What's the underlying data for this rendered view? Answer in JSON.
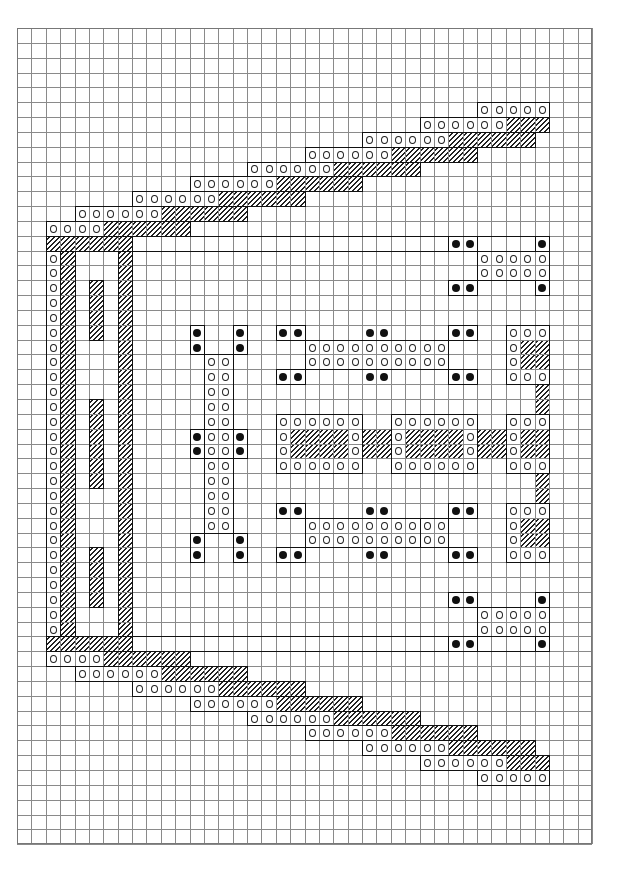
{
  "chart_data": {
    "type": "cross-stitch-chart",
    "title": "",
    "grid": {
      "cols": 40,
      "rows": 55,
      "cell_w": 14.375,
      "cell_h": 14.84,
      "origin": [
        17,
        28
      ]
    },
    "symbols": {
      "o": "open-circle stitch",
      "d": "filled-dot stitch",
      "h": "diagonal-hatch stitch"
    },
    "runs": [
      {
        "r": 5,
        "c0": 32,
        "c1": 36,
        "t": "o"
      },
      {
        "r": 6,
        "c0": 28,
        "c1": 33,
        "t": "o"
      },
      {
        "r": 6,
        "c0": 34,
        "c1": 36,
        "t": "h"
      },
      {
        "r": 7,
        "c0": 24,
        "c1": 29,
        "t": "o"
      },
      {
        "r": 7,
        "c0": 30,
        "c1": 35,
        "t": "h"
      },
      {
        "r": 8,
        "c0": 20,
        "c1": 25,
        "t": "o"
      },
      {
        "r": 8,
        "c0": 26,
        "c1": 31,
        "t": "h"
      },
      {
        "r": 9,
        "c0": 16,
        "c1": 21,
        "t": "o"
      },
      {
        "r": 9,
        "c0": 22,
        "c1": 27,
        "t": "h"
      },
      {
        "r": 10,
        "c0": 12,
        "c1": 17,
        "t": "o"
      },
      {
        "r": 10,
        "c0": 18,
        "c1": 23,
        "t": "h"
      },
      {
        "r": 11,
        "c0": 8,
        "c1": 13,
        "t": "o"
      },
      {
        "r": 11,
        "c0": 14,
        "c1": 19,
        "t": "h"
      },
      {
        "r": 12,
        "c0": 4,
        "c1": 9,
        "t": "o"
      },
      {
        "r": 12,
        "c0": 10,
        "c1": 15,
        "t": "h"
      },
      {
        "r": 13,
        "c0": 2,
        "c1": 5,
        "t": "o"
      },
      {
        "r": 13,
        "c0": 6,
        "c1": 11,
        "t": "h"
      },
      {
        "r": 14,
        "c0": 2,
        "c1": 7,
        "t": "h"
      },
      {
        "r": 41,
        "c0": 2,
        "c1": 7,
        "t": "h"
      },
      {
        "r": 42,
        "c0": 2,
        "c1": 5,
        "t": "o"
      },
      {
        "r": 42,
        "c0": 6,
        "c1": 11,
        "t": "h"
      },
      {
        "r": 43,
        "c0": 4,
        "c1": 9,
        "t": "o"
      },
      {
        "r": 43,
        "c0": 10,
        "c1": 15,
        "t": "h"
      },
      {
        "r": 44,
        "c0": 8,
        "c1": 13,
        "t": "o"
      },
      {
        "r": 44,
        "c0": 14,
        "c1": 19,
        "t": "h"
      },
      {
        "r": 45,
        "c0": 12,
        "c1": 17,
        "t": "o"
      },
      {
        "r": 45,
        "c0": 18,
        "c1": 23,
        "t": "h"
      },
      {
        "r": 46,
        "c0": 16,
        "c1": 21,
        "t": "o"
      },
      {
        "r": 46,
        "c0": 22,
        "c1": 27,
        "t": "h"
      },
      {
        "r": 47,
        "c0": 20,
        "c1": 25,
        "t": "o"
      },
      {
        "r": 47,
        "c0": 26,
        "c1": 31,
        "t": "h"
      },
      {
        "r": 48,
        "c0": 24,
        "c1": 29,
        "t": "o"
      },
      {
        "r": 48,
        "c0": 30,
        "c1": 35,
        "t": "h"
      },
      {
        "r": 49,
        "c0": 28,
        "c1": 33,
        "t": "o"
      },
      {
        "r": 49,
        "c0": 34,
        "c1": 36,
        "t": "h"
      },
      {
        "r": 50,
        "c0": 32,
        "c1": 36,
        "t": "o"
      },
      {
        "r": 14,
        "c0": 30,
        "c1": 31,
        "t": "d"
      },
      {
        "r": 14,
        "c0": 36,
        "c1": 36,
        "t": "d"
      },
      {
        "r": 15,
        "c0": 32,
        "c1": 36,
        "t": "o"
      },
      {
        "r": 16,
        "c0": 32,
        "c1": 36,
        "t": "o"
      },
      {
        "r": 17,
        "c0": 30,
        "c1": 31,
        "t": "d"
      },
      {
        "r": 17,
        "c0": 36,
        "c1": 36,
        "t": "d"
      },
      {
        "r": 20,
        "c0": 12,
        "c1": 12,
        "t": "d"
      },
      {
        "r": 20,
        "c0": 15,
        "c1": 15,
        "t": "d"
      },
      {
        "r": 21,
        "c0": 12,
        "c1": 12,
        "t": "d"
      },
      {
        "r": 21,
        "c0": 15,
        "c1": 15,
        "t": "d"
      },
      {
        "r": 22,
        "c0": 13,
        "c1": 14,
        "t": "o"
      },
      {
        "r": 23,
        "c0": 13,
        "c1": 14,
        "t": "o"
      },
      {
        "r": 24,
        "c0": 13,
        "c1": 14,
        "t": "o"
      },
      {
        "r": 25,
        "c0": 13,
        "c1": 14,
        "t": "o"
      },
      {
        "r": 26,
        "c0": 13,
        "c1": 14,
        "t": "o"
      },
      {
        "r": 27,
        "c0": 12,
        "c1": 12,
        "t": "d"
      },
      {
        "r": 27,
        "c0": 13,
        "c1": 14,
        "t": "o"
      },
      {
        "r": 27,
        "c0": 15,
        "c1": 15,
        "t": "d"
      },
      {
        "r": 28,
        "c0": 12,
        "c1": 12,
        "t": "d"
      },
      {
        "r": 28,
        "c0": 13,
        "c1": 14,
        "t": "o"
      },
      {
        "r": 28,
        "c0": 15,
        "c1": 15,
        "t": "d"
      },
      {
        "r": 29,
        "c0": 13,
        "c1": 14,
        "t": "o"
      },
      {
        "r": 30,
        "c0": 13,
        "c1": 14,
        "t": "o"
      },
      {
        "r": 31,
        "c0": 13,
        "c1": 14,
        "t": "o"
      },
      {
        "r": 32,
        "c0": 13,
        "c1": 14,
        "t": "o"
      },
      {
        "r": 33,
        "c0": 13,
        "c1": 14,
        "t": "o"
      },
      {
        "r": 34,
        "c0": 12,
        "c1": 12,
        "t": "d"
      },
      {
        "r": 34,
        "c0": 15,
        "c1": 15,
        "t": "d"
      },
      {
        "r": 35,
        "c0": 12,
        "c1": 12,
        "t": "d"
      },
      {
        "r": 35,
        "c0": 15,
        "c1": 15,
        "t": "d"
      },
      {
        "r": 20,
        "c0": 18,
        "c1": 19,
        "t": "d"
      },
      {
        "r": 20,
        "c0": 24,
        "c1": 25,
        "t": "d"
      },
      {
        "r": 20,
        "c0": 30,
        "c1": 31,
        "t": "d"
      },
      {
        "r": 21,
        "c0": 20,
        "c1": 29,
        "t": "o"
      },
      {
        "r": 22,
        "c0": 20,
        "c1": 29,
        "t": "o"
      },
      {
        "r": 23,
        "c0": 18,
        "c1": 19,
        "t": "d"
      },
      {
        "r": 23,
        "c0": 24,
        "c1": 25,
        "t": "d"
      },
      {
        "r": 23,
        "c0": 30,
        "c1": 31,
        "t": "d"
      },
      {
        "r": 26,
        "c0": 18,
        "c1": 23,
        "t": "o"
      },
      {
        "r": 26,
        "c0": 26,
        "c1": 31,
        "t": "o"
      },
      {
        "r": 27,
        "c0": 18,
        "c1": 18,
        "t": "o"
      },
      {
        "r": 27,
        "c0": 19,
        "c1": 22,
        "t": "h"
      },
      {
        "r": 27,
        "c0": 23,
        "c1": 23,
        "t": "o"
      },
      {
        "r": 27,
        "c0": 24,
        "c1": 25,
        "t": "h"
      },
      {
        "r": 27,
        "c0": 26,
        "c1": 26,
        "t": "o"
      },
      {
        "r": 27,
        "c0": 27,
        "c1": 30,
        "t": "h"
      },
      {
        "r": 27,
        "c0": 31,
        "c1": 31,
        "t": "o"
      },
      {
        "r": 27,
        "c0": 32,
        "c1": 33,
        "t": "h"
      },
      {
        "r": 28,
        "c0": 18,
        "c1": 18,
        "t": "o"
      },
      {
        "r": 28,
        "c0": 19,
        "c1": 22,
        "t": "h"
      },
      {
        "r": 28,
        "c0": 23,
        "c1": 23,
        "t": "o"
      },
      {
        "r": 28,
        "c0": 24,
        "c1": 25,
        "t": "h"
      },
      {
        "r": 28,
        "c0": 26,
        "c1": 26,
        "t": "o"
      },
      {
        "r": 28,
        "c0": 27,
        "c1": 30,
        "t": "h"
      },
      {
        "r": 28,
        "c0": 31,
        "c1": 31,
        "t": "o"
      },
      {
        "r": 28,
        "c0": 32,
        "c1": 33,
        "t": "h"
      },
      {
        "r": 29,
        "c0": 18,
        "c1": 23,
        "t": "o"
      },
      {
        "r": 29,
        "c0": 26,
        "c1": 31,
        "t": "o"
      },
      {
        "r": 32,
        "c0": 18,
        "c1": 19,
        "t": "d"
      },
      {
        "r": 32,
        "c0": 24,
        "c1": 25,
        "t": "d"
      },
      {
        "r": 32,
        "c0": 30,
        "c1": 31,
        "t": "d"
      },
      {
        "r": 33,
        "c0": 20,
        "c1": 29,
        "t": "o"
      },
      {
        "r": 34,
        "c0": 20,
        "c1": 29,
        "t": "o"
      },
      {
        "r": 35,
        "c0": 18,
        "c1": 19,
        "t": "d"
      },
      {
        "r": 35,
        "c0": 24,
        "c1": 25,
        "t": "d"
      },
      {
        "r": 35,
        "c0": 30,
        "c1": 31,
        "t": "d"
      },
      {
        "r": 20,
        "c0": 34,
        "c1": 36,
        "t": "o"
      },
      {
        "r": 21,
        "c0": 34,
        "c1": 34,
        "t": "o"
      },
      {
        "r": 21,
        "c0": 35,
        "c1": 36,
        "t": "h"
      },
      {
        "r": 22,
        "c0": 34,
        "c1": 34,
        "t": "o"
      },
      {
        "r": 22,
        "c0": 35,
        "c1": 36,
        "t": "h"
      },
      {
        "r": 23,
        "c0": 34,
        "c1": 36,
        "t": "o"
      },
      {
        "r": 24,
        "c0": 36,
        "c1": 36,
        "t": "h"
      },
      {
        "r": 25,
        "c0": 36,
        "c1": 36,
        "t": "h"
      },
      {
        "r": 26,
        "c0": 34,
        "c1": 36,
        "t": "o"
      },
      {
        "r": 27,
        "c0": 34,
        "c1": 34,
        "t": "o"
      },
      {
        "r": 27,
        "c0": 35,
        "c1": 36,
        "t": "h"
      },
      {
        "r": 28,
        "c0": 34,
        "c1": 34,
        "t": "o"
      },
      {
        "r": 28,
        "c0": 35,
        "c1": 36,
        "t": "h"
      },
      {
        "r": 29,
        "c0": 34,
        "c1": 36,
        "t": "o"
      },
      {
        "r": 30,
        "c0": 36,
        "c1": 36,
        "t": "h"
      },
      {
        "r": 31,
        "c0": 36,
        "c1": 36,
        "t": "h"
      },
      {
        "r": 32,
        "c0": 34,
        "c1": 36,
        "t": "o"
      },
      {
        "r": 33,
        "c0": 34,
        "c1": 34,
        "t": "o"
      },
      {
        "r": 33,
        "c0": 35,
        "c1": 36,
        "t": "h"
      },
      {
        "r": 34,
        "c0": 34,
        "c1": 34,
        "t": "o"
      },
      {
        "r": 34,
        "c0": 35,
        "c1": 36,
        "t": "h"
      },
      {
        "r": 35,
        "c0": 34,
        "c1": 36,
        "t": "o"
      },
      {
        "r": 38,
        "c0": 30,
        "c1": 31,
        "t": "d"
      },
      {
        "r": 38,
        "c0": 36,
        "c1": 36,
        "t": "d"
      },
      {
        "r": 39,
        "c0": 32,
        "c1": 36,
        "t": "o"
      },
      {
        "r": 40,
        "c0": 32,
        "c1": 36,
        "t": "o"
      },
      {
        "r": 41,
        "c0": 30,
        "c1": 31,
        "t": "d"
      },
      {
        "r": 41,
        "c0": 36,
        "c1": 36,
        "t": "d"
      }
    ],
    "column_runs": [
      {
        "c": 2,
        "r0": 15,
        "r1": 40,
        "t": "o"
      },
      {
        "c": 3,
        "r0": 15,
        "r1": 40,
        "t": "h"
      },
      {
        "c": 7,
        "r0": 15,
        "r1": 40,
        "t": "h"
      },
      {
        "c": 5,
        "r0": 17,
        "r1": 20,
        "t": "h"
      },
      {
        "c": 5,
        "r0": 25,
        "r1": 30,
        "t": "h"
      },
      {
        "c": 5,
        "r0": 35,
        "r1": 38,
        "t": "h"
      }
    ],
    "outlines": [
      {
        "c0": 4,
        "r0": 15,
        "c1": 6,
        "r1": 40
      },
      {
        "c0": 2,
        "r0": 15,
        "c1": 2,
        "r1": 40
      },
      {
        "c0": 12,
        "r0": 20,
        "c1": 12,
        "r1": 21
      },
      {
        "c0": 15,
        "r0": 20,
        "c1": 15,
        "r1": 21
      },
      {
        "c0": 13,
        "r0": 22,
        "c1": 14,
        "r1": 33
      },
      {
        "c0": 12,
        "r0": 27,
        "c1": 15,
        "r1": 28
      },
      {
        "c0": 12,
        "r0": 34,
        "c1": 12,
        "r1": 35
      },
      {
        "c0": 15,
        "r0": 34,
        "c1": 15,
        "r1": 35
      },
      {
        "c0": 18,
        "r0": 20,
        "c1": 19,
        "r1": 20
      },
      {
        "c0": 18,
        "r0": 23,
        "c1": 19,
        "r1": 23
      },
      {
        "c0": 20,
        "r0": 21,
        "c1": 29,
        "r1": 22
      },
      {
        "c0": 30,
        "r0": 20,
        "c1": 31,
        "r1": 20
      },
      {
        "c0": 30,
        "r0": 23,
        "c1": 31,
        "r1": 23
      },
      {
        "c0": 18,
        "r0": 26,
        "c1": 23,
        "r1": 29
      },
      {
        "c0": 26,
        "r0": 26,
        "c1": 31,
        "r1": 29
      },
      {
        "c0": 34,
        "r0": 20,
        "c1": 36,
        "r1": 23
      },
      {
        "c0": 34,
        "r0": 26,
        "c1": 36,
        "r1": 29
      },
      {
        "c0": 34,
        "r0": 32,
        "c1": 36,
        "r1": 35
      },
      {
        "c0": 18,
        "r0": 32,
        "c1": 19,
        "r1": 32
      },
      {
        "c0": 18,
        "r0": 35,
        "c1": 19,
        "r1": 35
      },
      {
        "c0": 20,
        "r0": 33,
        "c1": 29,
        "r1": 34
      },
      {
        "c0": 30,
        "r0": 32,
        "c1": 31,
        "r1": 32
      },
      {
        "c0": 30,
        "r0": 35,
        "c1": 31,
        "r1": 35
      },
      {
        "c0": 28,
        "r0": 33,
        "c1": 29,
        "r1": 34
      },
      {
        "c0": 30,
        "r0": 14,
        "c1": 31,
        "r1": 14
      },
      {
        "c0": 36,
        "r0": 14,
        "c1": 36,
        "r1": 14
      },
      {
        "c0": 32,
        "r0": 15,
        "c1": 36,
        "r1": 16
      },
      {
        "c0": 30,
        "r0": 17,
        "c1": 31,
        "r1": 17
      },
      {
        "c0": 36,
        "r0": 17,
        "c1": 36,
        "r1": 17
      },
      {
        "c0": 30,
        "r0": 38,
        "c1": 31,
        "r1": 38
      },
      {
        "c0": 36,
        "r0": 38,
        "c1": 36,
        "r1": 38
      },
      {
        "c0": 32,
        "r0": 39,
        "c1": 36,
        "r1": 40
      },
      {
        "c0": 30,
        "r0": 41,
        "c1": 31,
        "r1": 41
      },
      {
        "c0": 36,
        "r0": 41,
        "c1": 36,
        "r1": 41
      }
    ],
    "axes": {
      "grid": true,
      "x_ticks": [],
      "y_ticks": []
    },
    "legend": []
  }
}
